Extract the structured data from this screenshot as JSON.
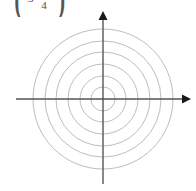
{
  "figure": {
    "background_color": "#ffffff",
    "circle_color": "#b5b5b5",
    "axis_color": "#555555",
    "text_color": "#4a4a4a"
  },
  "formula": {
    "visible_fragment": "( 4 )",
    "left_paren": "(",
    "right_paren": ")",
    "numerator": "π",
    "denominator": "4",
    "lead_term": "3"
  },
  "chart_data": {
    "type": "polar-grid",
    "title": "",
    "xlabel": "",
    "ylabel": "",
    "center": {
      "x": 103,
      "y": 99
    },
    "circle_count": 6,
    "circle_radii": [
      12,
      23,
      35,
      47,
      58,
      70
    ],
    "grid": true,
    "legend": "none",
    "axes": {
      "x_axis": {
        "x_start": 16,
        "x_end": 191,
        "y": 99,
        "arrow_end": "right"
      },
      "y_axis": {
        "x": 103,
        "y_start": 11,
        "y_end": 184,
        "arrow_end": "top"
      }
    },
    "radial_lines": 0,
    "tick_labels": [],
    "data_points": []
  }
}
